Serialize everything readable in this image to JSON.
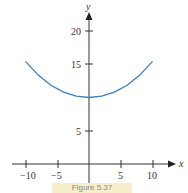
{
  "chart_data": {
    "type": "line",
    "title": "",
    "xlabel": "x",
    "ylabel": "y",
    "xlim": [
      -11,
      11
    ],
    "ylim": [
      0,
      22
    ],
    "x_ticks": [
      -10,
      -5,
      5,
      10
    ],
    "x_tick_labels": [
      "−10",
      "−5",
      "5",
      "10"
    ],
    "y_ticks": [
      5,
      20,
      15
    ],
    "y_tick_labels": [
      "5",
      "20",
      "15"
    ],
    "grid": false,
    "legend": null,
    "series": [
      {
        "name": "y = 10 cosh(x/10)",
        "color": "#3a7fc1",
        "x": [
          -10,
          -8,
          -6,
          -4,
          -2,
          0,
          2,
          4,
          6,
          8,
          10
        ],
        "values": [
          15.43,
          13.37,
          11.85,
          10.81,
          10.2,
          10.0,
          10.2,
          10.81,
          11.85,
          13.37,
          15.43
        ]
      }
    ]
  },
  "caption": "Figure 5.37"
}
